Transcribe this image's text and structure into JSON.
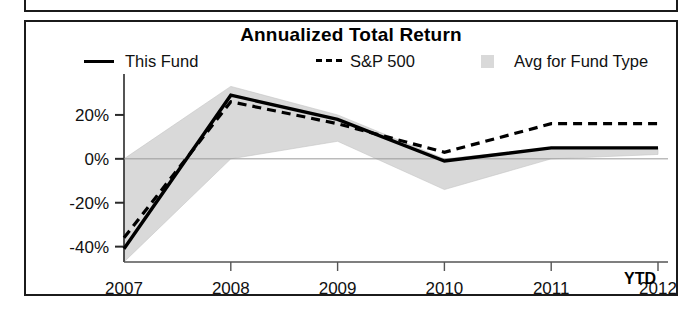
{
  "chart_data": {
    "type": "line",
    "title": "Annualized Total Return",
    "xlabel": "",
    "ylabel": "",
    "x": [
      "2007",
      "2008",
      "2009",
      "2010",
      "2011",
      "2012"
    ],
    "categories": [
      "2007",
      "2008",
      "2009",
      "2010",
      "2011",
      "2012"
    ],
    "x_axis_note": "YTD",
    "ylim": [
      -47,
      35
    ],
    "yticks": [
      20,
      0,
      -20,
      -40
    ],
    "ytick_labels": [
      "20%",
      "0%",
      "-20%",
      "-40%"
    ],
    "grid": false,
    "legend_position": "top",
    "series": [
      {
        "name": "This Fund",
        "style": "solid",
        "color": "#000000",
        "values": [
          -41,
          29,
          18,
          -1,
          5,
          5
        ]
      },
      {
        "name": "S&P 500",
        "style": "dashed",
        "color": "#000000",
        "values": [
          -36,
          26,
          16,
          3,
          16,
          16
        ]
      },
      {
        "name": "Avg for Fund Type",
        "style": "band",
        "color": "#d9d9d9",
        "band_upper": [
          0,
          33,
          20,
          0,
          5,
          5
        ],
        "band_lower": [
          -47,
          0,
          8,
          -14,
          0,
          2
        ]
      }
    ]
  },
  "chart": {
    "title": "Annualized Total Return",
    "ytd_label": "YTD",
    "legend": [
      {
        "label": "This Fund",
        "marker": "solid-line-swatch"
      },
      {
        "label": "S&P 500",
        "marker": "dashed-line-swatch"
      },
      {
        "label": "Avg for Fund Type",
        "marker": "gray-band-swatch"
      }
    ],
    "y_axis": {
      "labels": [
        "20%",
        "0%",
        "-20%",
        "-40%"
      ]
    },
    "x_axis": {
      "labels": [
        "2007",
        "2008",
        "2009",
        "2010",
        "2011",
        "2012"
      ]
    }
  },
  "colors": {
    "line": "#000000",
    "band": "#d9d9d9",
    "frame": "#1b1b1b",
    "background": "#ffffff"
  }
}
